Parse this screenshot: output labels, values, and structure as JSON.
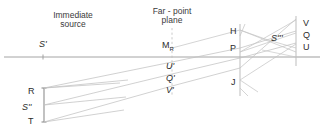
{
  "diagram": {
    "title_hidden": "Optical ray diagram: immediate source, far-point plane and image points",
    "background": "#ffffff",
    "line_color": "#b9b9b9",
    "axis_color": "#9a9a9a",
    "text_color": "#2b2b2b",
    "headers": [
      {
        "id": "immediate-source",
        "line1": "Immediate",
        "line2": "source",
        "x": 73,
        "y": 11
      },
      {
        "id": "far-point-plane",
        "line1": "Far - point",
        "line2": "plane",
        "x": 172,
        "y": 7
      }
    ],
    "labels": [
      {
        "id": "s-prime",
        "text": "S'",
        "x": 39,
        "y": 40
      },
      {
        "id": "m-r",
        "text": "M",
        "sub": "R",
        "x": 162,
        "y": 41
      },
      {
        "id": "h",
        "text": "H",
        "x": 230,
        "y": 27
      },
      {
        "id": "p",
        "text": "P",
        "x": 230,
        "y": 44
      },
      {
        "id": "j",
        "text": "J",
        "x": 231,
        "y": 78
      },
      {
        "id": "s-triple",
        "text": "S'''",
        "x": 271,
        "y": 34
      },
      {
        "id": "v",
        "text": "V",
        "x": 303,
        "y": 19
      },
      {
        "id": "q",
        "text": "Q",
        "x": 303,
        "y": 31
      },
      {
        "id": "u",
        "text": "U",
        "x": 303,
        "y": 43
      },
      {
        "id": "u-prime",
        "text": "U'",
        "x": 166,
        "y": 62
      },
      {
        "id": "q-prime",
        "text": "Q'",
        "x": 166,
        "y": 74
      },
      {
        "id": "v-prime",
        "text": "V'",
        "x": 166,
        "y": 86
      },
      {
        "id": "r",
        "text": "R",
        "x": 28,
        "y": 87
      },
      {
        "id": "s-double",
        "text": "S''",
        "x": 24,
        "y": 103
      },
      {
        "id": "t",
        "text": "T",
        "x": 28,
        "y": 117
      }
    ],
    "axis": {
      "y": 57,
      "x1": 4,
      "x2": 320,
      "tick_x": 43,
      "label": "optical-axis"
    },
    "far_point_dashes": {
      "x": 172,
      "y1": 28,
      "y2": 96
    },
    "verticals": [
      {
        "id": "lens-plane",
        "x": 240,
        "y1": 24,
        "y2": 96
      },
      {
        "id": "image-plane",
        "x": 296,
        "y1": 16,
        "y2": 66
      }
    ],
    "source_bar": {
      "id": "source-object",
      "x": 44,
      "y1": 88,
      "y2": 122
    },
    "rays": "ray bundle from R, S'' and T converging rightward through the far-point plane toward V, Q, U"
  }
}
